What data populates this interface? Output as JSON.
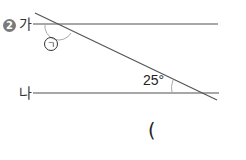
{
  "problem": {
    "number": "2",
    "line_labels": [
      "가",
      "나"
    ],
    "known_angle": "25°",
    "unknown_angle_label": "ㄱ",
    "answer_open_paren": "("
  },
  "colors": {
    "lines": "#8a8a8a",
    "transversal": "#555555",
    "text": "#333333"
  }
}
